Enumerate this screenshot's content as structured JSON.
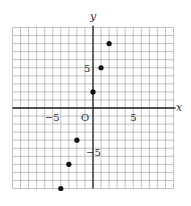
{
  "chart_data": {
    "type": "scatter",
    "title": "",
    "xlabel": "x",
    "ylabel": "y",
    "xlim": [
      -10,
      10
    ],
    "ylim": [
      -10,
      10
    ],
    "grid": true,
    "grid_step": 1,
    "origin_label": "O",
    "x_tick_labels": [
      {
        "value": -5,
        "label": "−5"
      },
      {
        "value": 5,
        "label": "5"
      }
    ],
    "y_tick_labels": [
      {
        "value": 5,
        "label": "5"
      },
      {
        "value": -5,
        "label": "−5"
      }
    ],
    "points": [
      {
        "x": -4,
        "y": -10
      },
      {
        "x": -3,
        "y": -7
      },
      {
        "x": -2,
        "y": -4
      },
      {
        "x": 0,
        "y": 2
      },
      {
        "x": 1,
        "y": 5
      },
      {
        "x": 2,
        "y": 8
      }
    ],
    "colors": {
      "grid": "#9a9a9a",
      "axis": "#222222",
      "point": "#111111"
    }
  }
}
